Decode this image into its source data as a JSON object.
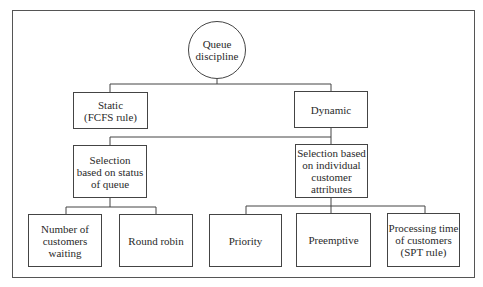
{
  "diagram": {
    "type": "tree",
    "root": {
      "id": "queue-discipline",
      "label": "Queue\ndiscipline",
      "shape": "circle",
      "children": [
        "static",
        "dynamic"
      ]
    },
    "nodes": {
      "static": {
        "label": "Static\n(FCFS rule)",
        "children": []
      },
      "dynamic": {
        "label": "Dynamic",
        "children": [
          "selection-status",
          "selection-attributes"
        ]
      },
      "selection_status": {
        "label": "Selection\nbased on status\nof queue",
        "children": [
          "number-waiting",
          "round-robin"
        ]
      },
      "selection_attributes": {
        "label": "Selection based\non individual\ncustomer\nattributes",
        "children": [
          "priority",
          "preemptive",
          "processing-time"
        ]
      },
      "number_waiting": {
        "label": "Number of\ncustomers\nwaiting"
      },
      "round_robin": {
        "label": "Round robin"
      },
      "priority": {
        "label": "Priority"
      },
      "preemptive": {
        "label": "Preemptive"
      },
      "processing_time": {
        "label": "Processing time\nof customers\n(SPT rule)"
      }
    },
    "colors": {
      "line": "#444444",
      "background": "#ffffff",
      "text": "#2a2a2a"
    }
  }
}
